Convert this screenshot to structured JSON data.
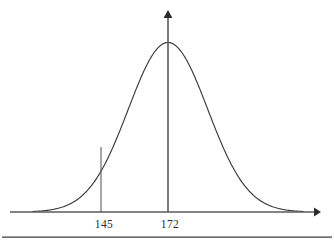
{
  "figure": {
    "title": "",
    "background_color": "#ffffff",
    "curve_color": "#3a3a3a",
    "axis_color": "#5b5b5b",
    "label_color": "#2d2d2d",
    "footer_rule_color": "#3d3d3d"
  },
  "axes": {
    "x_axis": {
      "name": "horizontal-axis",
      "y_pixel": 212,
      "x_start_pixel": 10,
      "x_end_pixel": 320,
      "arrow": "right"
    },
    "y_axis": {
      "name": "vertical-axis",
      "x_pixel": 168,
      "y_top_pixel": 11,
      "y_bottom_pixel": 212,
      "arrow": "up"
    }
  },
  "ticks": [
    {
      "name": "tick-145",
      "label": "145",
      "x_pixel": 101,
      "label_x_pixel": 104,
      "label_y_pixel": 228,
      "line_top_pixel": 147,
      "line_bottom_pixel": 212,
      "has_line": true
    },
    {
      "name": "tick-172",
      "label": "172",
      "x_pixel": 168,
      "label_x_pixel": 170,
      "label_y_pixel": 228,
      "line_top_pixel": 11,
      "line_bottom_pixel": 212,
      "has_line": false
    }
  ],
  "footer_rule": {
    "name": "footer-divider",
    "y_pixel": 237,
    "x_start_pixel": 2,
    "x_end_pixel": 332
  },
  "chart_data": {
    "type": "line",
    "title": "",
    "subtitle": "",
    "xlabel": "",
    "ylabel": "",
    "grid": false,
    "legend": "none",
    "distribution": "normal",
    "mean": 172,
    "marked_value": 145,
    "std_dev_estimate": 16,
    "annotations": [
      {
        "label": "145",
        "x": 145,
        "type": "vertical-segment",
        "note": "vertical line from axis up to about 0.33 of peak height"
      },
      {
        "label": "172",
        "x": 172,
        "type": "axis-tick",
        "note": "mean, coincides with vertical axis"
      }
    ],
    "xlim": [
      112,
      234
    ],
    "ylim": [
      0,
      1
    ],
    "tick_labels": [
      "145",
      "172"
    ],
    "x": [
      112,
      117,
      122,
      127,
      132,
      137,
      142,
      145,
      147,
      152,
      157,
      162,
      167,
      172,
      177,
      182,
      187,
      192,
      197,
      202,
      207,
      212,
      217,
      222,
      227,
      232
    ],
    "y": [
      0.009,
      0.018,
      0.033,
      0.058,
      0.097,
      0.153,
      0.228,
      0.28,
      0.32,
      0.425,
      0.53,
      0.72,
      0.9,
      1.0,
      0.96,
      0.86,
      0.72,
      0.55,
      0.39,
      0.25,
      0.15,
      0.082,
      0.042,
      0.02,
      0.009,
      0.004
    ]
  }
}
